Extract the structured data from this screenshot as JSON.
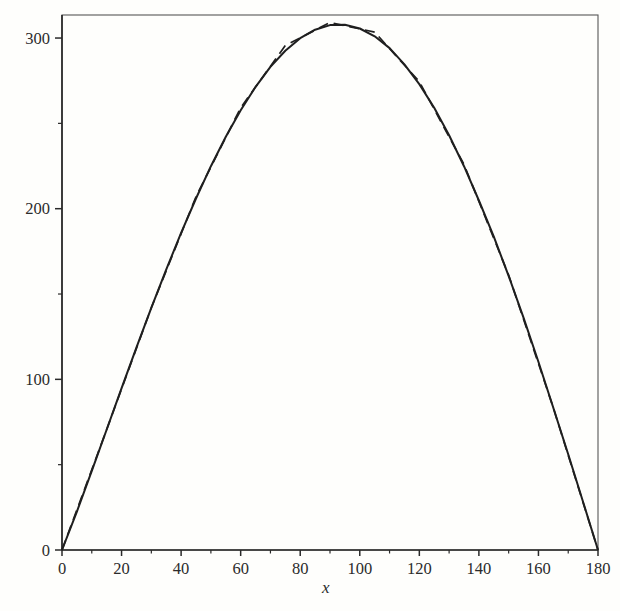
{
  "figure": {
    "background": "#fefefc",
    "ink_color": "#1f1f1f",
    "frame_color": "#565656",
    "axis_color": "#2a2a2a",
    "label_color": "#2b2b2b"
  },
  "chart_data": {
    "type": "line",
    "title": "",
    "xlabel": "x",
    "ylabel": "",
    "xlim": [
      0,
      180
    ],
    "ylim": [
      0,
      313.5
    ],
    "grid": false,
    "legend": "none",
    "x_major_ticks": [
      0,
      20,
      40,
      60,
      80,
      100,
      120,
      140,
      160,
      180
    ],
    "x_major_tick_labels": [
      "0",
      "20",
      "40",
      "60",
      "80",
      "100",
      "120",
      "140",
      "160",
      "180"
    ],
    "x_minor_ticks": [
      10,
      30,
      50,
      70,
      90,
      110,
      130,
      150,
      170
    ],
    "y_major_ticks": [
      0,
      100,
      200,
      300
    ],
    "y_major_tick_labels": [
      "0",
      "100",
      "200",
      "300"
    ],
    "y_minor_ticks": [
      50,
      150,
      250
    ],
    "series": [
      {
        "name": "solid-curve",
        "style": "solid",
        "points": [
          [
            0,
            0
          ],
          [
            5,
            22.5
          ],
          [
            10,
            46.4
          ],
          [
            15,
            70.6
          ],
          [
            20,
            94.8
          ],
          [
            25,
            118.6
          ],
          [
            30,
            141.9
          ],
          [
            35,
            164.3
          ],
          [
            40,
            185.8
          ],
          [
            45,
            206.0
          ],
          [
            50,
            224.9
          ],
          [
            55,
            242.2
          ],
          [
            60,
            257.7
          ],
          [
            65,
            271.4
          ],
          [
            70,
            283.1
          ],
          [
            75,
            292.6
          ],
          [
            80,
            299.9
          ],
          [
            85,
            304.9
          ],
          [
            90,
            307.6
          ],
          [
            95,
            307.8
          ],
          [
            100,
            305.6
          ],
          [
            105,
            301.0
          ],
          [
            110,
            294.1
          ],
          [
            115,
            284.6
          ],
          [
            120,
            273.0
          ],
          [
            125,
            259.1
          ],
          [
            130,
            243.0
          ],
          [
            135,
            224.9
          ],
          [
            140,
            204.8
          ],
          [
            145,
            183.6
          ],
          [
            150,
            160.5
          ],
          [
            155,
            136.0
          ],
          [
            160,
            110.3
          ],
          [
            165,
            83.4
          ],
          [
            170,
            56.1
          ],
          [
            175,
            28.1
          ],
          [
            180,
            0
          ]
        ]
      },
      {
        "name": "dashed-curve",
        "style": "dashed",
        "points": [
          [
            0,
            0
          ],
          [
            15,
            70.6
          ],
          [
            30,
            141.9
          ],
          [
            45,
            207.0
          ],
          [
            60,
            259.2
          ],
          [
            75,
            295.6
          ],
          [
            90,
            309.1
          ],
          [
            105,
            303.5
          ],
          [
            120,
            274.5
          ],
          [
            135,
            225.9
          ],
          [
            150,
            161.0
          ],
          [
            165,
            83.4
          ],
          [
            180,
            0
          ]
        ]
      }
    ]
  }
}
